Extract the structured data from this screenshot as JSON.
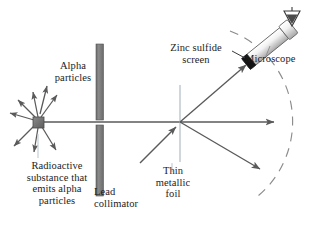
{
  "figure": {
    "background_color": "#ffffff",
    "line_color": "#5a5a5a",
    "text_color": "#1c1c1c",
    "lead_color": "#7a7a7a",
    "source_color": "#6e6e6e",
    "screen_color": "#151515",
    "width": 316,
    "height": 235
  },
  "labels": {
    "alpha_particles": "Alpha\nparticles",
    "radioactive_substance": "Radioactive\nsubstance that\nemits alpha\nparticles",
    "lead_collimator": "Lead\ncollimator",
    "thin_metallic_foil": "Thin\nmetallic\nfoil",
    "zinc_sulfide_screen": "Zinc sulfide\nscreen",
    "microscope": "Microscope"
  },
  "components": {
    "source": {
      "name": "radioactive-source",
      "x": 38,
      "y": 122,
      "size": 10
    },
    "collimator": {
      "name": "lead-collimator",
      "x": 96,
      "y_top": 44,
      "y_bottom": 196,
      "width": 7,
      "slit_y": 122,
      "slit_height": 5
    },
    "foil": {
      "name": "thin-metallic-foil",
      "x": 180,
      "y_top": 85,
      "y_bottom": 162
    },
    "scatter_point": {
      "x": 180,
      "y": 122
    },
    "detector_arc": {
      "name": "detector-arc",
      "center_x": 180,
      "center_y": 122,
      "radius": 97,
      "style": "dashed"
    },
    "zinc_sulfide_screen": {
      "x": 247,
      "y": 62,
      "angle_deg": -38
    },
    "microscope": {
      "x": 258,
      "y": 52,
      "angle_deg": -38,
      "length": 60
    },
    "eye": {
      "x": 292,
      "y": 18
    }
  },
  "rays": {
    "emitted_arrow_count": 8,
    "beam": {
      "from_x": 44,
      "from_y": 122,
      "to_x": 180,
      "to_y": 122
    },
    "undeflected": {
      "from_x": 180,
      "from_y": 122,
      "to_x": 272,
      "to_y": 122
    },
    "scattered_up": {
      "from_x": 180,
      "from_y": 122,
      "to_x": 245,
      "to_y": 66
    },
    "scattered_down": {
      "from_x": 180,
      "from_y": 122,
      "to_x": 258,
      "to_y": 168
    },
    "incoming_deflected": {
      "from_x": 140,
      "from_y": 162,
      "to_x": 176,
      "to_y": 126
    }
  }
}
